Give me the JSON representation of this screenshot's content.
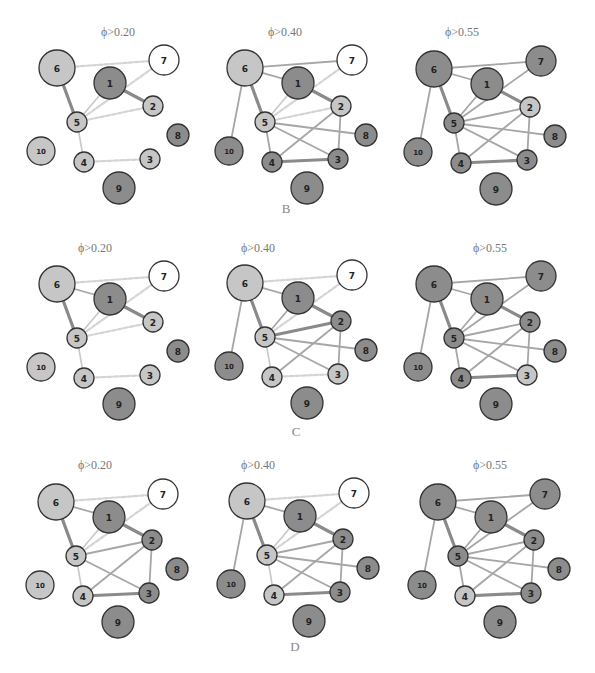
{
  "colors": {
    "node_light": "#c6c6c6",
    "node_dark": "#8c8c8c",
    "node_white": "#ffffff",
    "node_border": "#333333",
    "edge_thick": "#8a8a8a",
    "edge_mid": "#a6a6a6",
    "edge_light": "#c8c8c8",
    "edge_dashed": "#d4d4d4"
  },
  "layout": {
    "relative_positions": {
      "6": [
        0,
        0,
        18
      ],
      "1": [
        53,
        15,
        16
      ],
      "7": [
        107,
        -8,
        15
      ],
      "2": [
        96,
        38,
        10
      ],
      "5": [
        20,
        54,
        10
      ],
      "8": [
        121,
        67,
        11
      ],
      "10": [
        -16,
        83,
        14
      ],
      "4": [
        27,
        94,
        10
      ],
      "3": [
        93,
        91,
        10
      ],
      "9": [
        62,
        120,
        16
      ]
    }
  },
  "sections": [
    {
      "label": "B",
      "label_pos": [
        286,
        213
      ],
      "panels": [
        {
          "title": "ϕ>0.20",
          "title_pos": [
            118,
            36
          ],
          "origin": [
            57,
            68
          ],
          "fills": {
            "6": "light",
            "1": "dark",
            "7": "white",
            "2": "light",
            "5": "light",
            "8": "dark",
            "10": "light",
            "4": "light",
            "3": "light",
            "9": "dark"
          },
          "edges": [
            [
              "6",
              "5",
              "thick"
            ],
            [
              "1",
              "2",
              "thick"
            ],
            [
              "1",
              "5",
              "light"
            ],
            [
              "5",
              "7",
              "dashed"
            ],
            [
              "5",
              "2",
              "dashed"
            ],
            [
              "6",
              "7",
              "dashed"
            ],
            [
              "5",
              "4",
              "light"
            ],
            [
              "4",
              "3",
              "dashed"
            ]
          ]
        },
        {
          "title": "ϕ>0.40",
          "title_pos": [
            285,
            36
          ],
          "origin": [
            245,
            68
          ],
          "fills": {
            "6": "light",
            "1": "dark",
            "7": "white",
            "2": "light",
            "5": "light",
            "8": "dark",
            "10": "dark",
            "4": "dark",
            "3": "dark",
            "9": "dark"
          },
          "edges": [
            [
              "6",
              "7",
              "mid"
            ],
            [
              "6",
              "1",
              "mid"
            ],
            [
              "6",
              "5",
              "thick"
            ],
            [
              "6",
              "10",
              "mid"
            ],
            [
              "1",
              "2",
              "thick"
            ],
            [
              "1",
              "5",
              "light"
            ],
            [
              "5",
              "7",
              "dashed"
            ],
            [
              "5",
              "2",
              "dashed"
            ],
            [
              "5",
              "8",
              "mid"
            ],
            [
              "5",
              "3",
              "mid"
            ],
            [
              "5",
              "4",
              "mid"
            ],
            [
              "4",
              "3",
              "thick"
            ],
            [
              "4",
              "2",
              "mid"
            ],
            [
              "2",
              "3",
              "mid"
            ]
          ]
        },
        {
          "title": "ϕ>0.55",
          "title_pos": [
            462,
            36
          ],
          "origin": [
            434,
            69
          ],
          "fills": {
            "6": "dark",
            "1": "dark",
            "7": "dark",
            "2": "light",
            "5": "dark",
            "8": "dark",
            "10": "dark",
            "4": "dark",
            "3": "dark",
            "9": "dark"
          },
          "edges": [
            [
              "6",
              "7",
              "mid"
            ],
            [
              "6",
              "1",
              "mid"
            ],
            [
              "6",
              "5",
              "thick"
            ],
            [
              "6",
              "10",
              "mid"
            ],
            [
              "1",
              "2",
              "thick"
            ],
            [
              "1",
              "5",
              "mid"
            ],
            [
              "5",
              "7",
              "mid"
            ],
            [
              "5",
              "2",
              "mid"
            ],
            [
              "5",
              "8",
              "mid"
            ],
            [
              "5",
              "3",
              "mid"
            ],
            [
              "5",
              "4",
              "mid"
            ],
            [
              "4",
              "3",
              "thick"
            ],
            [
              "4",
              "2",
              "mid"
            ],
            [
              "2",
              "3",
              "mid"
            ]
          ]
        }
      ]
    },
    {
      "label": "C",
      "label_pos": [
        296,
        436
      ],
      "panels": [
        {
          "title": "ϕ>0.20",
          "title_pos": [
            95,
            252
          ],
          "origin": [
            57,
            284
          ],
          "fills": {
            "6": "light",
            "1": "dark",
            "7": "white",
            "2": "light",
            "5": "light",
            "8": "dark",
            "10": "light",
            "4": "light",
            "3": "light",
            "9": "dark"
          },
          "edges": [
            [
              "6",
              "7",
              "dashed"
            ],
            [
              "6",
              "1",
              "mid"
            ],
            [
              "6",
              "5",
              "thick"
            ],
            [
              "1",
              "2",
              "thick"
            ],
            [
              "1",
              "5",
              "light"
            ],
            [
              "5",
              "7",
              "dashed"
            ],
            [
              "5",
              "2",
              "dashed"
            ],
            [
              "5",
              "4",
              "light"
            ],
            [
              "4",
              "3",
              "dashed"
            ]
          ]
        },
        {
          "title": "ϕ>0.40",
          "title_pos": [
            258,
            252
          ],
          "origin": [
            245,
            283
          ],
          "fills": {
            "6": "light",
            "1": "dark",
            "7": "white",
            "2": "dark",
            "5": "light",
            "8": "dark",
            "10": "dark",
            "4": "light",
            "3": "light",
            "9": "dark"
          },
          "edges": [
            [
              "6",
              "7",
              "dashed"
            ],
            [
              "6",
              "1",
              "mid"
            ],
            [
              "6",
              "5",
              "thick"
            ],
            [
              "6",
              "10",
              "mid"
            ],
            [
              "1",
              "2",
              "thick"
            ],
            [
              "1",
              "5",
              "mid"
            ],
            [
              "5",
              "7",
              "dashed"
            ],
            [
              "5",
              "2",
              "thick"
            ],
            [
              "5",
              "8",
              "mid"
            ],
            [
              "5",
              "3",
              "mid"
            ],
            [
              "5",
              "4",
              "light"
            ],
            [
              "4",
              "3",
              "dashed"
            ],
            [
              "4",
              "2",
              "mid"
            ],
            [
              "2",
              "3",
              "mid"
            ]
          ]
        },
        {
          "title": "ϕ>0.55",
          "title_pos": [
            490,
            252
          ],
          "origin": [
            434,
            284
          ],
          "fills": {
            "6": "dark",
            "1": "dark",
            "7": "dark",
            "2": "dark",
            "5": "dark",
            "8": "dark",
            "10": "dark",
            "4": "dark",
            "3": "light",
            "9": "dark"
          },
          "edges": [
            [
              "6",
              "7",
              "mid"
            ],
            [
              "6",
              "1",
              "mid"
            ],
            [
              "6",
              "5",
              "thick"
            ],
            [
              "6",
              "10",
              "mid"
            ],
            [
              "1",
              "2",
              "thick"
            ],
            [
              "1",
              "5",
              "mid"
            ],
            [
              "5",
              "7",
              "mid"
            ],
            [
              "5",
              "2",
              "mid"
            ],
            [
              "5",
              "8",
              "mid"
            ],
            [
              "5",
              "3",
              "mid"
            ],
            [
              "5",
              "4",
              "mid"
            ],
            [
              "4",
              "3",
              "thick"
            ],
            [
              "4",
              "2",
              "mid"
            ],
            [
              "2",
              "3",
              "mid"
            ]
          ]
        }
      ]
    },
    {
      "label": "D",
      "label_pos": [
        295,
        651
      ],
      "panels": [
        {
          "title": "ϕ>0.20",
          "title_pos": [
            95,
            469
          ],
          "origin": [
            56,
            502
          ],
          "fills": {
            "6": "light",
            "1": "dark",
            "7": "white",
            "2": "dark",
            "5": "light",
            "8": "dark",
            "10": "light",
            "4": "light",
            "3": "dark",
            "9": "dark"
          },
          "edges": [
            [
              "6",
              "7",
              "dashed"
            ],
            [
              "6",
              "1",
              "mid"
            ],
            [
              "6",
              "5",
              "thick"
            ],
            [
              "1",
              "2",
              "thick"
            ],
            [
              "1",
              "5",
              "light"
            ],
            [
              "5",
              "7",
              "dashed"
            ],
            [
              "5",
              "2",
              "mid"
            ],
            [
              "5",
              "3",
              "mid"
            ],
            [
              "5",
              "4",
              "light"
            ],
            [
              "4",
              "3",
              "thick"
            ],
            [
              "4",
              "2",
              "mid"
            ],
            [
              "2",
              "3",
              "mid"
            ]
          ]
        },
        {
          "title": "ϕ>0.40",
          "title_pos": [
            258,
            469
          ],
          "origin": [
            247,
            501
          ],
          "fills": {
            "6": "light",
            "1": "dark",
            "7": "white",
            "2": "dark",
            "5": "light",
            "8": "dark",
            "10": "dark",
            "4": "light",
            "3": "dark",
            "9": "dark"
          },
          "edges": [
            [
              "6",
              "7",
              "dashed"
            ],
            [
              "6",
              "1",
              "mid"
            ],
            [
              "6",
              "5",
              "thick"
            ],
            [
              "6",
              "10",
              "mid"
            ],
            [
              "1",
              "2",
              "thick"
            ],
            [
              "1",
              "5",
              "light"
            ],
            [
              "5",
              "7",
              "dashed"
            ],
            [
              "5",
              "2",
              "mid"
            ],
            [
              "5",
              "8",
              "mid"
            ],
            [
              "5",
              "3",
              "mid"
            ],
            [
              "5",
              "4",
              "light"
            ],
            [
              "4",
              "3",
              "thick"
            ],
            [
              "4",
              "2",
              "mid"
            ],
            [
              "2",
              "3",
              "mid"
            ]
          ]
        },
        {
          "title": "ϕ>0.55",
          "title_pos": [
            490,
            469
          ],
          "origin": [
            438,
            502
          ],
          "fills": {
            "6": "dark",
            "1": "dark",
            "7": "dark",
            "2": "dark",
            "5": "dark",
            "8": "dark",
            "10": "dark",
            "4": "light",
            "3": "dark",
            "9": "dark"
          },
          "edges": [
            [
              "6",
              "7",
              "mid"
            ],
            [
              "6",
              "1",
              "mid"
            ],
            [
              "6",
              "5",
              "thick"
            ],
            [
              "6",
              "10",
              "mid"
            ],
            [
              "1",
              "2",
              "thick"
            ],
            [
              "1",
              "5",
              "mid"
            ],
            [
              "5",
              "7",
              "mid"
            ],
            [
              "5",
              "2",
              "mid"
            ],
            [
              "5",
              "8",
              "mid"
            ],
            [
              "5",
              "3",
              "mid"
            ],
            [
              "5",
              "4",
              "mid"
            ],
            [
              "4",
              "3",
              "thick"
            ],
            [
              "4",
              "2",
              "mid"
            ],
            [
              "2",
              "3",
              "mid"
            ]
          ]
        }
      ]
    }
  ]
}
